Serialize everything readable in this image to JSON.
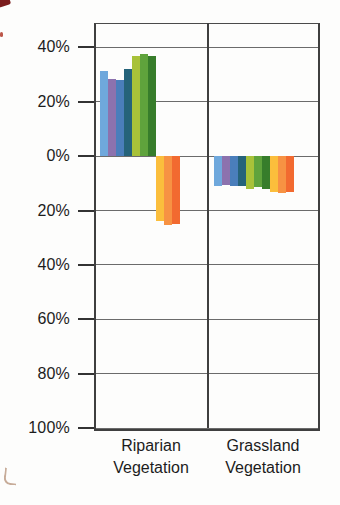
{
  "chart_data": {
    "type": "bar",
    "title": "",
    "xlabel": "",
    "ylabel": "",
    "legend": "none",
    "grid": true,
    "ylim": [
      -100,
      49
    ],
    "categories": [
      {
        "label": "Riparian Vegetation",
        "line1": "Riparian",
        "line2": "Vegetation"
      },
      {
        "label": "Grassland Vegetation",
        "line1": "Grassland",
        "line2": "Vegetation"
      }
    ],
    "series": [
      {
        "name": "light-blue",
        "color": "#6FA8DC",
        "values": [
          31.5,
          -11
        ]
      },
      {
        "name": "purple",
        "color": "#8C72AE",
        "values": [
          28.5,
          -10.5
        ]
      },
      {
        "name": "medium-blue",
        "color": "#4A7EBB",
        "values": [
          28,
          -11
        ]
      },
      {
        "name": "dark-teal-blue",
        "color": "#25637A",
        "values": [
          32,
          -11
        ]
      },
      {
        "name": "yellow-green",
        "color": "#A8C239",
        "values": [
          37,
          -12
        ]
      },
      {
        "name": "medium-green",
        "color": "#5FA33C",
        "values": [
          37.5,
          -11.5
        ]
      },
      {
        "name": "dark-green",
        "color": "#377D2B",
        "values": [
          37,
          -12
        ]
      },
      {
        "name": "yellow",
        "color": "#FBBE3C",
        "values": [
          -24,
          -13
        ]
      },
      {
        "name": "orange",
        "color": "#F79243",
        "values": [
          -25.5,
          -13.5
        ]
      },
      {
        "name": "dark-orange",
        "color": "#F26A30",
        "values": [
          -25,
          -13
        ]
      }
    ],
    "y_axis": {
      "ymax": 49,
      "ymin": -100,
      "ticks": [
        {
          "value": 40,
          "label": "40%"
        },
        {
          "value": 20,
          "label": "20%"
        },
        {
          "value": 0,
          "label": "0%"
        },
        {
          "value": -20,
          "label": "20%"
        },
        {
          "value": -40,
          "label": "40%"
        },
        {
          "value": -60,
          "label": "60%"
        },
        {
          "value": -80,
          "label": "80%"
        },
        {
          "value": -100,
          "label": "100%"
        }
      ]
    }
  },
  "colors": {
    "frame": "#3f3f3f",
    "gridline": "#6b6b6b",
    "text": "#1c1c1c",
    "background": "#ffffff"
  }
}
